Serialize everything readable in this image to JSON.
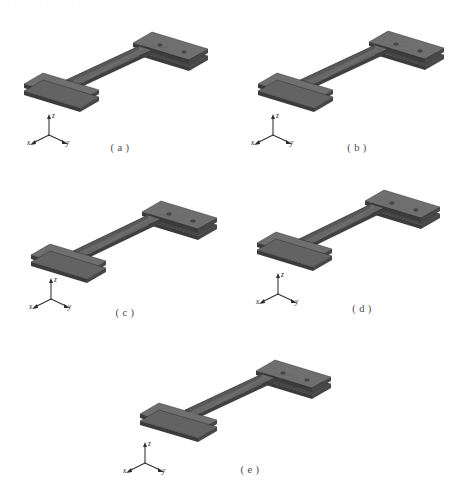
{
  "figure": {
    "background_color": "#ffffff",
    "scan_remnant_text": "·· ···  ····  ··· ···· ··· ···· ··",
    "specimen_colors": {
      "top_face": "#6f6f6f",
      "side_face": "#474747",
      "front_face": "#3b3b3b",
      "web_face": "#585858",
      "edge_line": "#2a2a2a",
      "hole": "#4c4c4c"
    },
    "axis_labels": {
      "x": "x",
      "y": "y",
      "z": "z"
    },
    "panels": [
      {
        "id": "a",
        "caption": "( a )"
      },
      {
        "id": "b",
        "caption": "( b )"
      },
      {
        "id": "c",
        "caption": "( c )"
      },
      {
        "id": "d",
        "caption": "( d )"
      },
      {
        "id": "e",
        "caption": "( e )"
      }
    ]
  }
}
